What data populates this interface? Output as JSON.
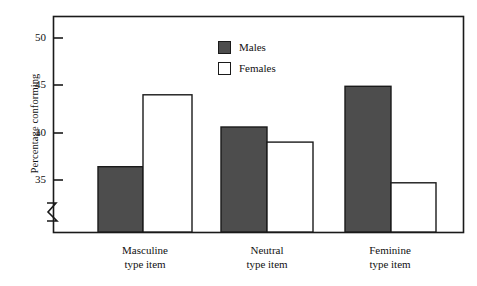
{
  "chart_data": {
    "type": "bar",
    "title": "",
    "xlabel": "",
    "ylabel": "Percentage conforming",
    "categories": [
      "Masculine type item",
      "Neutral type item",
      "Feminine type item"
    ],
    "category_lines": [
      [
        "Masculine",
        "type item"
      ],
      [
        "Neutral",
        "type item"
      ],
      [
        "Feminine",
        "type item"
      ]
    ],
    "series": [
      {
        "name": "Males",
        "color": "#4d4d4d",
        "values": [
          36.4,
          40.6,
          44.9
        ]
      },
      {
        "name": "Females",
        "color": "#ffffff",
        "values": [
          44.0,
          39.0,
          34.7
        ]
      }
    ],
    "yticks": [
      35,
      40,
      45,
      50
    ],
    "ytick_labels": [
      "35",
      "40",
      "45",
      "50"
    ],
    "ylim": [
      32.5,
      51.4
    ],
    "axis_break": true,
    "grid": false,
    "legend_position": "top-center",
    "frame": "box"
  },
  "legend": {
    "items": [
      {
        "label": "Males",
        "swatch": "filled-dark-square"
      },
      {
        "label": "Females",
        "swatch": "empty-white-square"
      }
    ]
  },
  "axis": {
    "y_title": "Percentage conforming",
    "y_tick_labels": [
      "50",
      "45",
      "40",
      "35"
    ],
    "break_symbol": "axis-break-zigzag"
  },
  "colors": {
    "males_fill": "#4d4d4d",
    "females_fill": "#ffffff",
    "line": "#1a1a1a",
    "background": "#ffffff"
  }
}
